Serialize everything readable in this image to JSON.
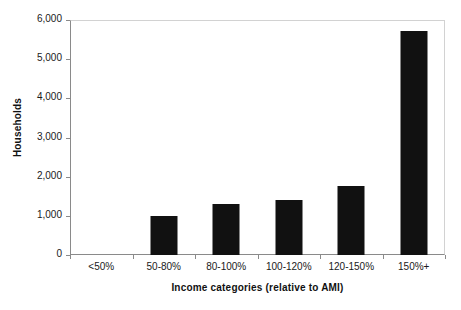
{
  "chart_data": {
    "type": "bar",
    "title": "",
    "xlabel": "Income categories (relative to AMI)",
    "ylabel": "Households",
    "categories": [
      "<50%",
      "50-80%",
      "80-100%",
      "100-120%",
      "120-150%",
      "150%+"
    ],
    "values": [
      0,
      1000,
      1290,
      1410,
      1760,
      5730
    ],
    "series": [
      {
        "name": "Households",
        "values": [
          0,
          1000,
          1290,
          1410,
          1760,
          5730
        ]
      }
    ],
    "ylim": [
      0,
      6000
    ],
    "ytick_values": [
      0,
      1000,
      2000,
      3000,
      4000,
      5000,
      6000
    ],
    "ytick_labels": [
      "0",
      "1,000",
      "2,000",
      "3,000",
      "4,000",
      "5,000",
      "6,000"
    ],
    "grid": false,
    "legend": "none",
    "bar_color": "#111111",
    "axis_color": "#8a8a8a",
    "background_color": "#ffffff"
  }
}
